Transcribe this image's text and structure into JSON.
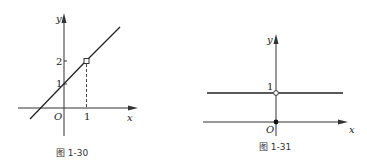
{
  "figures": [
    {
      "caption": "图 1-30",
      "x_axis_label": "x",
      "y_axis_label": "y",
      "origin_label": "O",
      "tick_labels": {
        "y": [
          "1",
          "2"
        ],
        "x": [
          "1"
        ]
      },
      "description": "Line y = x + 1 with an open point (hole) at (1, 2); dashed vertical line from (1,2) down to x = 1"
    },
    {
      "caption": "图 1-31",
      "x_axis_label": "x",
      "y_axis_label": "y",
      "origin_label": "O",
      "tick_labels": {
        "y": [
          "1"
        ]
      },
      "description": "Horizontal line y = 1 with an open point at (0, 1); filled point at origin (0, 0)"
    }
  ]
}
